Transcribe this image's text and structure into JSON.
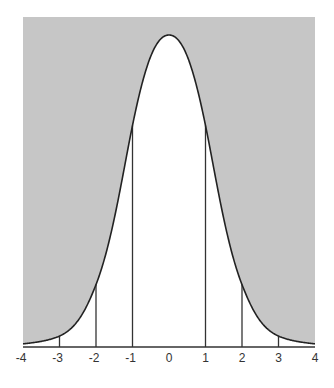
{
  "chart_data": {
    "type": "area",
    "title": "",
    "xlabel": "",
    "ylabel": "",
    "xlim": [
      -4,
      4
    ],
    "x_ticks": [
      "-4",
      "-3",
      "-2",
      "-1",
      "0",
      "1",
      "2",
      "3",
      "4"
    ],
    "vertical_lines_at": [
      -3,
      -2,
      -1,
      1,
      2,
      3
    ],
    "curve_points": [
      {
        "x": -4,
        "y": 0.01
      },
      {
        "x": -3,
        "y": 0.035
      },
      {
        "x": -2,
        "y": 0.2
      },
      {
        "x": -1,
        "y": 0.71
      },
      {
        "x": 0,
        "y": 1.0
      },
      {
        "x": 1,
        "y": 0.71
      },
      {
        "x": 2,
        "y": 0.2
      },
      {
        "x": 3,
        "y": 0.035
      },
      {
        "x": 4,
        "y": 0.01
      }
    ],
    "grid": false,
    "legend": null,
    "colors": {
      "shade": "#c6c6c6",
      "curve": "#222222",
      "background": "#ffffff"
    }
  }
}
